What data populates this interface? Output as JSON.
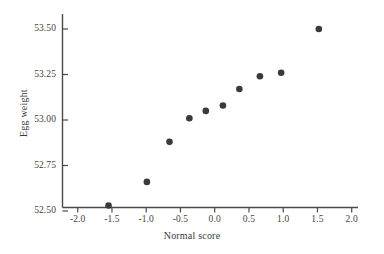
{
  "chart_data": {
    "type": "scatter",
    "title": "",
    "xlabel": "Normal score",
    "ylabel": "Egg weight",
    "xlim": [
      -2.2,
      2.3
    ],
    "ylim": [
      52.44,
      53.58
    ],
    "grid": false,
    "legend": null,
    "xticks": [
      -2.0,
      -1.5,
      -1.0,
      -0.5,
      0.0,
      0.5,
      1.0,
      1.5,
      2.0
    ],
    "xtick_labels": [
      "-2.0",
      "-1.5",
      "-1.0",
      "-0.5",
      "0.0",
      "0.5",
      "1.0",
      "1.5",
      "2.0"
    ],
    "yticks": [
      52.5,
      52.75,
      53.0,
      53.25,
      53.5
    ],
    "ytick_labels": [
      "52.50",
      "52.75",
      "53.00",
      "53.25",
      "53.50"
    ],
    "marker": "filled-circle",
    "marker_color": "#3a3a3c",
    "marker_size": 4.6,
    "axis_color": "#4a4a4c",
    "points": [
      {
        "x": -1.55,
        "y": 52.53
      },
      {
        "x": -0.99,
        "y": 52.66
      },
      {
        "x": -0.66,
        "y": 52.88
      },
      {
        "x": -0.37,
        "y": 53.01
      },
      {
        "x": -0.13,
        "y": 53.05
      },
      {
        "x": 0.12,
        "y": 53.08
      },
      {
        "x": 0.36,
        "y": 53.17
      },
      {
        "x": 0.66,
        "y": 53.24
      },
      {
        "x": 0.97,
        "y": 53.26
      },
      {
        "x": 1.52,
        "y": 53.5
      }
    ]
  },
  "figure": {
    "background": "#ffffff"
  }
}
